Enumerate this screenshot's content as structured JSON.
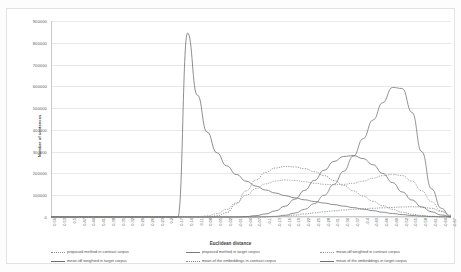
{
  "chart_data": {
    "type": "line",
    "title": "",
    "xlabel": "Euclidean distance",
    "ylabel": "Number of sentences",
    "ylim": [
      0,
      900000
    ],
    "grid": true,
    "legend_position": "bottom",
    "ytick_labels": [
      "900000",
      "800000",
      "700000",
      "600000",
      "500000",
      "400000",
      "300000",
      "200000",
      "100000",
      "0"
    ],
    "ytick_values": [
      900000,
      800000,
      700000,
      600000,
      500000,
      400000,
      300000,
      200000,
      100000,
      0
    ],
    "categories": [
      "0.56",
      "0.53",
      "0.5",
      "0.47",
      "0.44",
      "0.41",
      "0.38",
      "0.35",
      "0.32",
      "0.29",
      "0.26",
      "0.23",
      "0.2",
      "0.17",
      "0.14",
      "0.11",
      "0.08",
      "0.05",
      "0.02",
      "-0.01",
      "-0.04",
      "-0.07",
      "-0.1",
      "-0.13",
      "-0.16",
      "-0.19",
      "-0.22",
      "-0.25",
      "-0.28",
      "-0.31",
      "-0.34",
      "-0.37",
      "-0.4",
      "-0.43",
      "-0.46",
      "-0.49",
      "-0.52",
      "-0.55",
      "-0.58",
      "-0.61",
      "-0.64",
      "-0.67"
    ],
    "series": [
      {
        "name": "proposed method in contrast corpus",
        "style": "dotted",
        "color": "#8f8f8f",
        "values": [
          0,
          0,
          0,
          0,
          0,
          0,
          0,
          0,
          0,
          0,
          0,
          0,
          0,
          0,
          0,
          0,
          0,
          5000,
          20000,
          60000,
          120000,
          170000,
          205000,
          225000,
          232000,
          230000,
          222000,
          208000,
          190000,
          168000,
          145000,
          120000,
          96000,
          72000,
          52000,
          35000,
          22000,
          13000,
          7000,
          3500,
          1500,
          500
        ]
      },
      {
        "name": "proposed method in target corpus",
        "style": "solid",
        "color": "#7a7a7a",
        "values": [
          0,
          0,
          0,
          0,
          0,
          0,
          0,
          0,
          0,
          0,
          0,
          0,
          0,
          0,
          0,
          0,
          0,
          0,
          0,
          0,
          0,
          0,
          1000,
          3000,
          8000,
          18000,
          35000,
          62000,
          100000,
          150000,
          210000,
          280000,
          360000,
          445000,
          525000,
          595000,
          590000,
          480000,
          300000,
          130000,
          40000,
          0
        ]
      },
      {
        "name": "mean-idf weighted in contrast corpus",
        "style": "dotted",
        "color": "#9a9a9a",
        "values": [
          0,
          0,
          0,
          0,
          0,
          0,
          0,
          0,
          0,
          0,
          0,
          0,
          0,
          0,
          0,
          0,
          5000,
          15000,
          35000,
          65000,
          100000,
          130000,
          152000,
          165000,
          170000,
          168000,
          162000,
          155000,
          150000,
          148000,
          150000,
          155000,
          165000,
          178000,
          190000,
          196000,
          190000,
          165000,
          120000,
          70000,
          28000,
          6000
        ]
      },
      {
        "name": "mean-idf weighted in target corpus",
        "style": "solid",
        "color": "#6e6e6e",
        "values": [
          0,
          0,
          0,
          0,
          0,
          0,
          0,
          0,
          0,
          0,
          0,
          0,
          0,
          0,
          0,
          0,
          0,
          0,
          0,
          0,
          2000,
          6000,
          14000,
          28000,
          50000,
          82000,
          122000,
          168000,
          215000,
          255000,
          278000,
          282000,
          268000,
          240000,
          200000,
          158000,
          115000,
          78000,
          46000,
          24000,
          9000,
          2000
        ]
      },
      {
        "name": "mean of the embeddings in contrast corpus",
        "style": "dotted",
        "color": "#8a8a8a",
        "values": [
          0,
          0,
          0,
          0,
          0,
          0,
          0,
          0,
          0,
          0,
          0,
          0,
          0,
          0,
          0,
          0,
          0,
          0,
          0,
          0,
          0,
          0,
          0,
          2000,
          5000,
          9000,
          14000,
          19000,
          24000,
          28000,
          32000,
          35000,
          38000,
          40000,
          42000,
          44000,
          46000,
          47000,
          46000,
          40000,
          25000,
          8000
        ]
      },
      {
        "name": "mean of the embeddings in target corpus",
        "style": "solid",
        "color": "#707070",
        "values": [
          0,
          0,
          0,
          0,
          0,
          0,
          0,
          0,
          0,
          0,
          0,
          0,
          0,
          0,
          845000,
          560000,
          390000,
          295000,
          235000,
          195000,
          165000,
          142000,
          124000,
          110000,
          98000,
          88000,
          79000,
          71000,
          64000,
          57000,
          50000,
          43000,
          36000,
          29000,
          22000,
          16000,
          11000,
          7000,
          4000,
          2000,
          800,
          0
        ]
      }
    ]
  },
  "axes": {
    "y_title": "Number of sentences",
    "x_title": "Euclidean distance"
  },
  "legend": {
    "items": [
      {
        "label": "proposed method in contrast corpus",
        "style": "dotted"
      },
      {
        "label": "proposed method in target corpus",
        "style": "solid"
      },
      {
        "label": "mean-idf weighted in contrast corpus",
        "style": "dotted"
      },
      {
        "label": "mean-idf weighted in target corpus",
        "style": "solid"
      },
      {
        "label": "mean of the embeddings in contrast corpus",
        "style": "dotted"
      },
      {
        "label": "mean of the embeddings in target corpus",
        "style": "solid"
      }
    ]
  },
  "colors": {
    "grid": "#e8e8e8",
    "axis": "#c9c9c9",
    "text": "#5c5c5c",
    "frame": "#e2e2e2"
  }
}
